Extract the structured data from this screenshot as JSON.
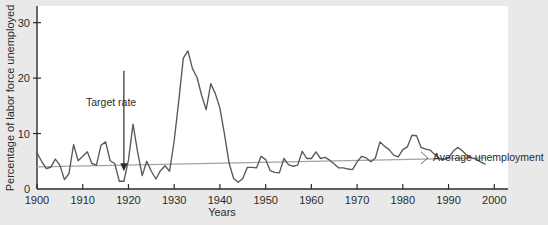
{
  "chart_data": {
    "type": "line",
    "title": "",
    "xlabel": "Years",
    "ylabel": "Percentage of labor force unemployed",
    "xlim": [
      1900,
      2003
    ],
    "ylim": [
      0,
      33
    ],
    "grid": false,
    "legend_position": "inline-right",
    "x_ticks": [
      1900,
      1910,
      1920,
      1930,
      1940,
      1950,
      1960,
      1970,
      1980,
      1990,
      2000
    ],
    "x_tick_labels": [
      "1900",
      "1910",
      "1920",
      "1930",
      "1940",
      "1950",
      "1960",
      "1970",
      "1980",
      "1990",
      "2000"
    ],
    "y_ticks": [
      0,
      10,
      20,
      30
    ],
    "y_tick_labels": [
      "0",
      "10",
      "20",
      "30"
    ],
    "series": [
      {
        "name": "Unemployment rate",
        "color": "#58585a",
        "x": [
          1900,
          1901,
          1902,
          1903,
          1904,
          1905,
          1906,
          1907,
          1908,
          1909,
          1910,
          1911,
          1912,
          1913,
          1914,
          1915,
          1916,
          1917,
          1918,
          1919,
          1920,
          1921,
          1922,
          1923,
          1924,
          1925,
          1926,
          1927,
          1928,
          1929,
          1930,
          1931,
          1932,
          1933,
          1934,
          1935,
          1936,
          1937,
          1938,
          1939,
          1940,
          1941,
          1942,
          1943,
          1944,
          1945,
          1946,
          1947,
          1948,
          1949,
          1950,
          1951,
          1952,
          1953,
          1954,
          1955,
          1956,
          1957,
          1958,
          1959,
          1960,
          1961,
          1962,
          1963,
          1964,
          1965,
          1966,
          1967,
          1968,
          1969,
          1970,
          1971,
          1972,
          1973,
          1974,
          1975,
          1976,
          1977,
          1978,
          1979,
          1980,
          1981,
          1982,
          1983,
          1984,
          1985,
          1986,
          1987,
          1988,
          1989,
          1990,
          1991,
          1992,
          1993,
          1994,
          1995,
          1996,
          1997,
          1998
        ],
        "values": [
          6.5,
          5.0,
          3.7,
          3.9,
          5.4,
          4.3,
          1.7,
          2.8,
          8.0,
          5.1,
          5.9,
          6.7,
          4.6,
          4.3,
          7.9,
          8.5,
          5.1,
          4.6,
          1.4,
          1.4,
          5.2,
          11.7,
          6.7,
          2.4,
          5.0,
          3.2,
          1.8,
          3.3,
          4.2,
          3.2,
          8.7,
          15.9,
          23.6,
          24.9,
          21.7,
          20.1,
          16.9,
          14.3,
          19.0,
          17.2,
          14.6,
          9.9,
          4.7,
          1.9,
          1.2,
          1.9,
          3.9,
          3.9,
          3.8,
          5.9,
          5.3,
          3.3,
          3.0,
          2.9,
          5.5,
          4.4,
          4.1,
          4.3,
          6.8,
          5.5,
          5.5,
          6.7,
          5.5,
          5.7,
          5.2,
          4.5,
          3.8,
          3.8,
          3.6,
          3.5,
          4.9,
          5.9,
          5.6,
          4.9,
          5.6,
          8.5,
          7.7,
          7.1,
          6.1,
          5.8,
          7.1,
          7.6,
          9.7,
          9.6,
          7.5,
          7.2,
          7.0,
          6.2,
          5.5,
          5.3,
          5.6,
          6.8,
          7.5,
          6.9,
          6.1,
          5.6,
          5.4,
          4.9,
          4.5
        ]
      },
      {
        "name": "Average unemployment",
        "color": "#a3a3a5",
        "x": [
          1900,
          1998
        ],
        "values": [
          4.0,
          5.6
        ]
      }
    ],
    "annotations": [
      {
        "name": "target-rate",
        "text": "Target rate",
        "x": 1919,
        "y": 1.4,
        "label_x": 1915,
        "label_y": 19.5,
        "arrow": "down"
      },
      {
        "name": "average-unemployment-label",
        "text": "Average unemployment",
        "x": 2001,
        "y": 5.6
      }
    ]
  }
}
